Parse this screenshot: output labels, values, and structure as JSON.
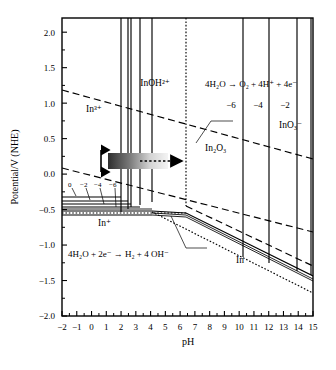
{
  "chart_data": {
    "type": "line",
    "title": "",
    "xlabel": "pH",
    "ylabel": "Potential/V (NHE)",
    "xlim": [
      -2,
      15
    ],
    "ylim": [
      -2.0,
      2.2
    ],
    "grid": false,
    "legend": "none",
    "x_ticks": [
      -2,
      -1,
      0,
      1,
      2,
      3,
      4,
      5,
      6,
      7,
      8,
      9,
      10,
      11,
      12,
      13,
      14,
      15
    ],
    "x_tick_labels": [
      "−2",
      "−1",
      "0",
      "1",
      "2",
      "3",
      "4",
      "5",
      "6",
      "7",
      "8",
      "9",
      "10",
      "11",
      "12",
      "13",
      "14",
      "15"
    ],
    "y_ticks": [
      2.0,
      1.5,
      1.0,
      0.5,
      0.0,
      -0.5,
      -1.0,
      -1.5,
      -2.0
    ],
    "y_tick_labels": [
      "2.0",
      "1.5",
      "1.0",
      "0.5",
      "0.0",
      "−0.5",
      "−1.0",
      "−1.5",
      "−2.0"
    ],
    "series": [
      {
        "name": "oxygen-evolution-line",
        "style": "dashed",
        "points": [
          [
            -2,
            1.35
          ],
          [
            15,
            0.27
          ]
        ]
      },
      {
        "name": "hydrogen-evolution-line",
        "style": "dashed",
        "points": [
          [
            -2,
            0.12
          ],
          [
            15,
            -0.88
          ]
        ]
      },
      {
        "name": "in3-to-in2o3-boundary-upper",
        "style": "solid",
        "points": [
          [
            -2,
            -0.33
          ],
          [
            4.4,
            -0.33
          ]
        ]
      },
      {
        "name": "in-plus-boundary",
        "style": "solid",
        "points": [
          [
            -2,
            -0.45
          ],
          [
            4.45,
            -0.45
          ]
        ]
      },
      {
        "name": "in-metal-boundary",
        "style": "solid",
        "points": [
          [
            -2,
            -0.47
          ],
          [
            6.35,
            -0.47
          ],
          [
            15,
            -1.15
          ]
        ]
      },
      {
        "name": "in-metal-dotted-lower",
        "style": "dotted",
        "points": [
          [
            4.45,
            -0.46
          ],
          [
            15,
            -1.6
          ]
        ]
      }
    ],
    "vertical_lines_ph": [
      2.2,
      2.7,
      2.9,
      3.5,
      4.35,
      6.35,
      10.2,
      12.0,
      13.9,
      14.85
    ],
    "concentration_labels": [
      "0",
      "−2",
      "−4",
      "−6"
    ],
    "concentration_labels_right": [
      "−6",
      "−4",
      "−2"
    ]
  },
  "axes": {
    "x_title": "pH",
    "y_title": "Potential/V (NHE)"
  },
  "annotations": {
    "species": [
      {
        "name": "in3plus",
        "text": "In³⁺"
      },
      {
        "name": "inoh2plus",
        "text": "InOH²⁺"
      },
      {
        "name": "in2o3",
        "text": "In₂O₃"
      },
      {
        "name": "ino3minus",
        "text": "InO₃⁻"
      },
      {
        "name": "inplus",
        "text": "In⁺"
      },
      {
        "name": "in-metal",
        "text": "In"
      }
    ],
    "equations": [
      {
        "name": "oxygen-evolution-equation",
        "text": "4H₂O → O₂ + 4H⁺ + 4e⁻"
      },
      {
        "name": "hydrogen-evolution-equation",
        "text": "4H₂O + 2e⁻ → H₂ + 4 OH⁻"
      }
    ],
    "concentration_left": [
      "0",
      "−2",
      "−4",
      "−6"
    ],
    "concentration_right": [
      "−6",
      "−4",
      "−2"
    ]
  },
  "colors": {
    "background": "#ffffff",
    "line": "#000000",
    "gradient_dark": "#3a3a3a",
    "gradient_light": "#f2f2f2"
  }
}
